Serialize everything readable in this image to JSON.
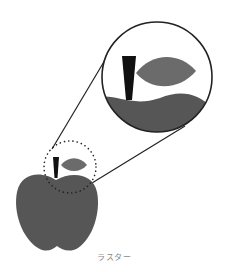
{
  "caption": "ラスター",
  "colors": {
    "apple": "#565656",
    "leaf": "#6b6b6b",
    "stem": "#111111",
    "outline": "#222222",
    "background": "#ffffff"
  },
  "figure": {
    "magnifier": {
      "center": [
        157,
        77
      ],
      "radius": 56
    },
    "focus_region": {
      "center": [
        70,
        167
      ],
      "radius": 26,
      "style": "dotted"
    }
  }
}
